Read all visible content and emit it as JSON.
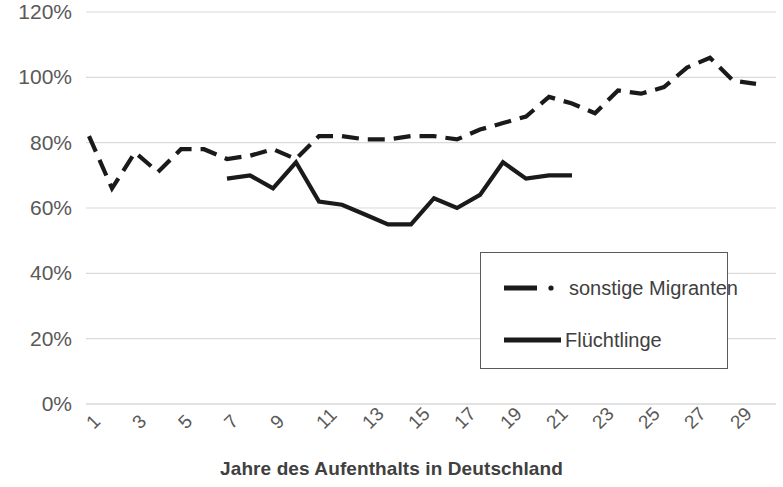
{
  "chart_data": {
    "type": "line",
    "title": "",
    "xlabel": "Jahre des Aufenthalts in Deutschland",
    "ylabel": "",
    "ylim": [
      0,
      120
    ],
    "ytick_labels": [
      "120%",
      "100%",
      "80%",
      "60%",
      "40%",
      "20%",
      "0%"
    ],
    "ytick_values": [
      120,
      100,
      80,
      60,
      40,
      20,
      0
    ],
    "xlim": [
      1,
      30
    ],
    "xtick_labels": [
      "1",
      "3",
      "5",
      "7",
      "9",
      "11",
      "13",
      "15",
      "17",
      "19",
      "21",
      "23",
      "25",
      "27",
      "29"
    ],
    "xtick_values": [
      1,
      3,
      5,
      7,
      9,
      11,
      13,
      15,
      17,
      19,
      21,
      23,
      25,
      27,
      29
    ],
    "grid": "horizontal",
    "legend_position": "inside-bottom-right",
    "series": [
      {
        "name": "sonstige Migranten",
        "style": "dashed",
        "color": "#1a1a1a",
        "x": [
          1,
          2,
          3,
          4,
          5,
          6,
          7,
          8,
          9,
          10,
          11,
          12,
          13,
          14,
          15,
          16,
          17,
          18,
          19,
          20,
          21,
          22,
          23,
          24,
          25,
          26,
          27,
          28,
          29,
          30
        ],
        "values": [
          82,
          66,
          77,
          71,
          78,
          78,
          75,
          76,
          78,
          75,
          82,
          82,
          81,
          81,
          82,
          82,
          81,
          84,
          86,
          88,
          94,
          92,
          89,
          96,
          95,
          97,
          103,
          106,
          99,
          98
        ]
      },
      {
        "name": "Flüchtlinge",
        "style": "solid",
        "color": "#1a1a1a",
        "x": [
          7,
          8,
          9,
          10,
          11,
          12,
          13,
          14,
          15,
          16,
          17,
          18,
          19,
          20,
          21,
          22
        ],
        "values": [
          69,
          70,
          66,
          74,
          62,
          61,
          58,
          55,
          55,
          63,
          60,
          64,
          74,
          69,
          70,
          70
        ]
      }
    ]
  },
  "legend": {
    "entries": [
      {
        "label": "sonstige Migranten",
        "style": "dashed"
      },
      {
        "label": "Flüchtlinge",
        "style": "solid"
      }
    ]
  }
}
